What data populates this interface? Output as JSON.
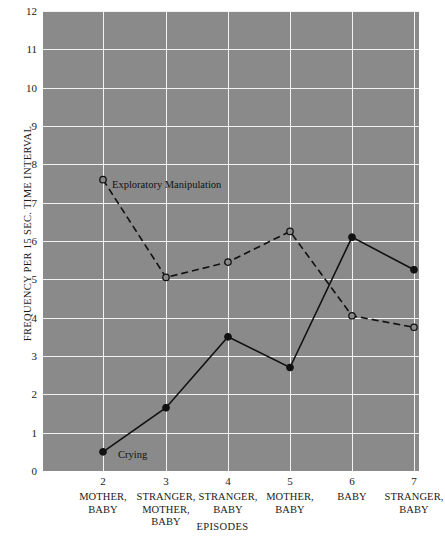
{
  "chart_data": {
    "type": "line",
    "title": "",
    "xlabel": "EPISODES",
    "ylabel": "FREQUENCY PER 15 SEC. TIME INTERVAL",
    "x": [
      2,
      3,
      4,
      5,
      6,
      7
    ],
    "categories": [
      "2",
      "3",
      "4",
      "5",
      "6",
      "7"
    ],
    "category_sublabels": [
      "MOTHER,\nBABY",
      "STRANGER,\nMOTHER,\nBABY",
      "STRANGER,\nBABY",
      "MOTHER,\nBABY",
      "BABY",
      "STRANGER,\nBABY"
    ],
    "ylim": [
      0,
      12
    ],
    "yticks": [
      0,
      1,
      2,
      3,
      4,
      5,
      6,
      7,
      8,
      9,
      10,
      11,
      12
    ],
    "grid": true,
    "legend_position": "inline-annotation",
    "plot_background": "#8a8a8a",
    "grid_color": "#f2f2f2",
    "line_color": "#111111",
    "series": [
      {
        "name": "Exploratory Manipulation",
        "values": [
          7.6,
          5.05,
          5.45,
          6.25,
          4.05,
          3.75
        ],
        "style": "dashed",
        "marker": "open-circle",
        "annotation_at": 2
      },
      {
        "name": "Crying",
        "values": [
          0.5,
          1.65,
          3.5,
          2.7,
          6.1,
          5.25
        ],
        "style": "solid",
        "marker": "filled-circle",
        "annotation_at": 2
      }
    ]
  },
  "axis": {
    "y_tick_labels": [
      "12",
      "11",
      "10",
      "9",
      "8",
      "7",
      "6",
      "5",
      "4",
      "3",
      "2",
      "1",
      "0"
    ],
    "y_title": "FREQUENCY PER 15 SEC. TIME INTERVAL",
    "x_title": "EPISODES"
  },
  "x_categories": [
    {
      "num": "2",
      "sub": "MOTHER,\nBABY"
    },
    {
      "num": "3",
      "sub": "STRANGER,\nMOTHER,\nBABY"
    },
    {
      "num": "4",
      "sub": "STRANGER,\nBABY"
    },
    {
      "num": "5",
      "sub": "MOTHER,\nBABY"
    },
    {
      "num": "6",
      "sub": "BABY"
    },
    {
      "num": "7",
      "sub": "STRANGER,\nBABY"
    }
  ],
  "annotations": {
    "exploratory": "Exploratory Manipulation",
    "crying": "Crying"
  }
}
